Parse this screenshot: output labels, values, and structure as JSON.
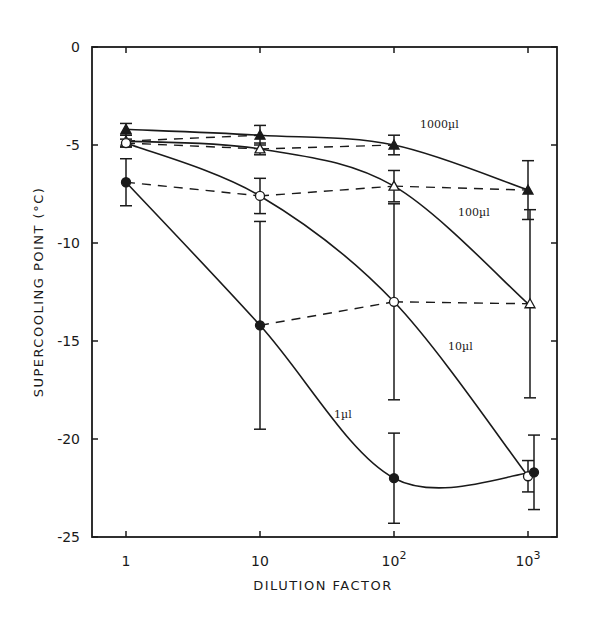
{
  "chart_data": {
    "type": "line",
    "title": "",
    "xlabel": "DILUTION FACTOR",
    "ylabel": "SUPERCOOLING POINT (°C)",
    "xscale": "log",
    "x": [
      1,
      10,
      100,
      1000
    ],
    "x_tick_labels": [
      "1",
      "10",
      "10",
      "10"
    ],
    "x_tick_exponents": [
      "",
      "",
      "2",
      "3"
    ],
    "y_ticks": [
      0,
      -5,
      -10,
      -15,
      -20,
      -25
    ],
    "y_tick_labels": [
      "0",
      "-5",
      "-10",
      "-15",
      "-20",
      "-25"
    ],
    "ylim": [
      -25,
      0
    ],
    "grid": false,
    "legend_position": "inline labels",
    "series": [
      {
        "name": "1000µl",
        "marker": "filled-triangle",
        "values": [
          -4.2,
          -4.5,
          -5.0,
          -7.3
        ],
        "error": [
          0.3,
          0.5,
          0.5,
          1.5
        ],
        "label_pos": {
          "x": 420,
          "y": 128
        }
      },
      {
        "name": "100µl",
        "marker": "open-triangle",
        "values": [
          -4.8,
          -5.2,
          -7.1,
          -13.1
        ],
        "error": [
          0.3,
          0.3,
          0.8,
          4.8
        ],
        "label_pos": {
          "x": 458,
          "y": 216
        }
      },
      {
        "name": "10µl",
        "marker": "open-circle",
        "values": [
          -4.9,
          -7.6,
          -13.0,
          -21.9
        ],
        "error": [
          0.2,
          0.9,
          5.0,
          0.8
        ],
        "label_pos": {
          "x": 448,
          "y": 350
        }
      },
      {
        "name": "1µl",
        "marker": "filled-circle",
        "values": [
          -6.9,
          -14.2,
          -22.0,
          -21.7
        ],
        "error": [
          1.2,
          5.3,
          2.3,
          1.9
        ],
        "label_pos": {
          "x": 334,
          "y": 418
        }
      }
    ],
    "dashed_connectors": "same-dilution points joined across series (iso-dilution lines)"
  }
}
